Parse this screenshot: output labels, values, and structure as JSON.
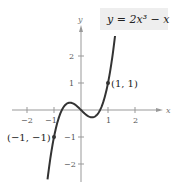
{
  "chart_data": {
    "type": "line",
    "equation_label": "y = 2x³ − x",
    "xlabel": "x",
    "ylabel": "y",
    "xlim": [
      -2.5,
      2.9
    ],
    "ylim": [
      -2.6,
      3.0
    ],
    "x_ticks": [
      -2,
      -1,
      1,
      2
    ],
    "y_ticks": [
      -2,
      -1,
      1,
      2
    ],
    "x_tick_labels": [
      "−2",
      "−1",
      "1",
      "2"
    ],
    "y_tick_labels": [
      "−2",
      "−1",
      "1",
      "2"
    ],
    "grid": false,
    "series": [
      {
        "name": "y = 2x^3 - x",
        "function": "2x^3 - x",
        "x": [
          -1.22,
          -1.0,
          -0.75,
          -0.5,
          -0.41,
          -0.25,
          0,
          0.25,
          0.41,
          0.5,
          0.75,
          1.0,
          1.26
        ],
        "y": [
          -2.41,
          -1.0,
          -0.09,
          0.25,
          0.27,
          0.22,
          0,
          -0.22,
          -0.27,
          -0.25,
          0.09,
          1.0,
          2.74
        ]
      }
    ],
    "annotations": [
      {
        "label": "(1, 1)",
        "x": 1,
        "y": 1
      },
      {
        "label": "(−1, −1)",
        "x": -1,
        "y": -1
      }
    ]
  },
  "labels": {
    "equation": "y = 2x³ − x",
    "x_axis": "x",
    "y_axis": "y",
    "point_a": "(1, 1)",
    "point_b": "(−1, −1)",
    "xt_m2": "−2",
    "xt_m1": "−1",
    "xt_1": "1",
    "xt_2": "2",
    "yt_2": "2",
    "yt_1": "1",
    "yt_m1": "−1",
    "yt_m2": "−2"
  }
}
